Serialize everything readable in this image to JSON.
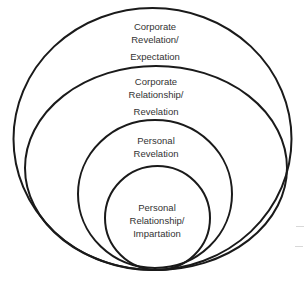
{
  "diagram": {
    "type": "nested-circles",
    "stroke_color": "#1a1a1a",
    "text_color": "#333333",
    "background": "#ffffff",
    "levels": [
      {
        "name": "corporate-revelation-expectation",
        "lines": [
          "Corporate",
          "Revelation/",
          "Expectation"
        ],
        "order": 1
      },
      {
        "name": "corporate-relationship-revelation",
        "lines": [
          "Corporate",
          "Relationship/",
          "Revelation"
        ],
        "order": 2
      },
      {
        "name": "personal-revelation",
        "lines": [
          "Personal",
          "Revelation"
        ],
        "order": 3
      },
      {
        "name": "personal-relationship-impartation",
        "lines": [
          "Personal",
          "Relationship/",
          "Impartation"
        ],
        "order": 4
      }
    ]
  }
}
